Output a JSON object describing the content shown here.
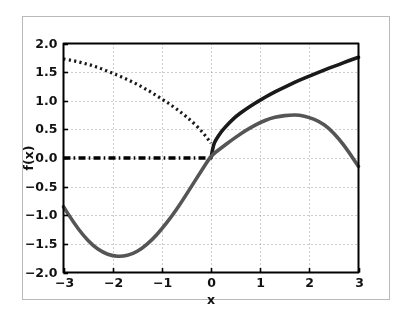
{
  "figure": {
    "background_color": "#ffffff",
    "frame_color": "#b9b9b9",
    "axes_color": "#000000",
    "grid_color": "#9a9a9a"
  },
  "chart_data": {
    "type": "line",
    "title": "",
    "xlabel": "x",
    "ylabel": "f(x)",
    "xlim": [
      -3,
      3
    ],
    "ylim": [
      -2.0,
      2.0
    ],
    "xticks": [
      -3,
      -2,
      -1,
      0,
      1,
      2,
      3
    ],
    "xticklabels": [
      "−3",
      "−2",
      "−1",
      "0",
      "1",
      "2",
      "3"
    ],
    "yticks": [
      -2.0,
      -1.5,
      -1.0,
      -0.5,
      0.0,
      0.5,
      1.0,
      1.5,
      2.0
    ],
    "yticklabels": [
      "−2.0",
      "−1.5",
      "−1.0",
      "−0.5",
      "0.0",
      "0.5",
      "1.0",
      "1.5",
      "2.0"
    ],
    "grid": true,
    "grid_linestyle": "dotted",
    "legend": null,
    "series": [
      {
        "name": "dotted-branch",
        "linestyle": "dotted",
        "color": "#1a1a1a",
        "linewidth": 3.2,
        "x": [
          -3.0,
          -2.8,
          -2.6,
          -2.4,
          -2.2,
          -2.0,
          -1.8,
          -1.6,
          -1.4,
          -1.2,
          -1.0,
          -0.8,
          -0.6,
          -0.4,
          -0.2,
          -0.05,
          0.0
        ],
        "y": [
          1.73,
          1.7,
          1.66,
          1.61,
          1.55,
          1.48,
          1.41,
          1.33,
          1.24,
          1.14,
          1.03,
          0.92,
          0.79,
          0.65,
          0.48,
          0.32,
          0.26
        ]
      },
      {
        "name": "zero-dashdot-branch",
        "linestyle": "dashdot",
        "color": "#000000",
        "linewidth": 3.6,
        "x": [
          -3.0,
          -2.5,
          -2.0,
          -1.5,
          -1.0,
          -0.5,
          0.0
        ],
        "y": [
          0.0,
          0.0,
          0.0,
          0.0,
          0.0,
          0.0,
          0.0
        ]
      },
      {
        "name": "sqrt-branch",
        "linestyle": "solid",
        "color": "#1a1a1a",
        "linewidth": 3.6,
        "x": [
          0.0,
          0.05,
          0.1,
          0.2,
          0.3,
          0.4,
          0.5,
          0.7,
          0.9,
          1.0,
          1.2,
          1.4,
          1.6,
          1.8,
          2.0,
          2.2,
          2.4,
          2.6,
          2.8,
          3.0
        ],
        "y": [
          0.0,
          0.23,
          0.32,
          0.45,
          0.55,
          0.64,
          0.72,
          0.85,
          0.96,
          1.01,
          1.11,
          1.2,
          1.28,
          1.36,
          1.43,
          1.5,
          1.57,
          1.63,
          1.7,
          1.76
        ]
      },
      {
        "name": "wave-curve",
        "linestyle": "solid",
        "color": "#555555",
        "linewidth": 3.6,
        "x": [
          -3.0,
          -2.8,
          -2.6,
          -2.4,
          -2.2,
          -2.0,
          -1.8,
          -1.6,
          -1.4,
          -1.2,
          -1.0,
          -0.8,
          -0.6,
          -0.4,
          -0.2,
          0.0,
          0.2,
          0.4,
          0.6,
          0.8,
          1.0,
          1.2,
          1.4,
          1.6,
          1.8,
          2.0,
          2.2,
          2.4,
          2.6,
          2.8,
          3.0
        ],
        "y": [
          -0.85,
          -1.12,
          -1.35,
          -1.53,
          -1.65,
          -1.71,
          -1.72,
          -1.68,
          -1.58,
          -1.43,
          -1.24,
          -1.02,
          -0.77,
          -0.5,
          -0.23,
          0.04,
          0.17,
          0.3,
          0.42,
          0.53,
          0.62,
          0.69,
          0.73,
          0.75,
          0.75,
          0.71,
          0.64,
          0.52,
          0.34,
          0.11,
          -0.15
        ]
      }
    ]
  }
}
